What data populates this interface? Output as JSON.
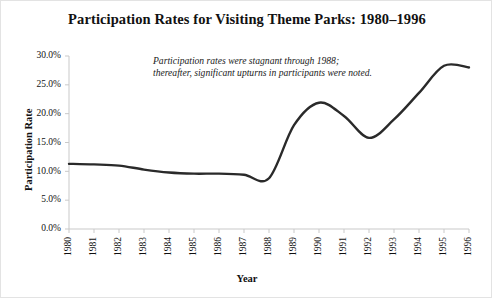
{
  "chart_data": {
    "type": "line",
    "title": "Participation Rates for Visiting Theme Parks: 1980–1996",
    "xlabel": "Year",
    "ylabel": "Participation Rate",
    "grid": false,
    "legend": "none",
    "xlim": [
      1980,
      1996
    ],
    "ylim": [
      0,
      30
    ],
    "ytick_labels": [
      "30.0%",
      "25.0%",
      "20.0%",
      "15.0%",
      "10.0%",
      "5.0%",
      "0.0%"
    ],
    "ytick_values": [
      30,
      25,
      20,
      15,
      10,
      5,
      0
    ],
    "categories": [
      "1980",
      "1981",
      "1982",
      "1983",
      "1984",
      "1985",
      "1986",
      "1987",
      "1988",
      "1989",
      "1990",
      "1991",
      "1992",
      "1993",
      "1994",
      "1995",
      "1996"
    ],
    "x": [
      1980,
      1981,
      1982,
      1983,
      1984,
      1985,
      1986,
      1987,
      1988,
      1989,
      1990,
      1991,
      1992,
      1993,
      1994,
      1995,
      1996
    ],
    "values": [
      11.3,
      11.2,
      11.0,
      10.3,
      9.8,
      9.6,
      9.6,
      9.4,
      8.8,
      18.0,
      21.9,
      19.6,
      15.8,
      19.0,
      23.6,
      28.3,
      28.0
    ],
    "series": [
      {
        "name": "Participation Rate",
        "color": "#2a2a2a",
        "values": [
          11.3,
          11.2,
          11.0,
          10.3,
          9.8,
          9.6,
          9.6,
          9.4,
          8.8,
          18.0,
          21.9,
          19.6,
          15.8,
          19.0,
          23.6,
          28.3,
          28.0
        ]
      }
    ],
    "annotations": [
      {
        "name": "trend-note",
        "line1": "Participation rates were stagnant through 1988;",
        "line2": "thereafter, significant upturns in participants were noted."
      }
    ]
  },
  "style": {
    "line_color": "#2a2a2a",
    "axis_color": "#c9c9c9",
    "text_color": "#111111",
    "background": "#ffffff",
    "border_color": "#e3e3e3"
  }
}
